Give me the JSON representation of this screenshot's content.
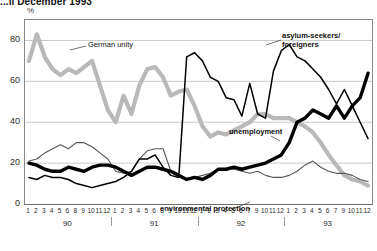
{
  "title": "...il December 1993",
  "axis": {
    "y_unit": "%",
    "y_ticks": [
      0,
      20,
      40,
      60,
      80
    ],
    "ylim": [
      0,
      90
    ],
    "year_labels": [
      "90",
      "91",
      "92",
      "93"
    ],
    "month_labels_90": [
      "1",
      "2",
      "3",
      "4",
      "5",
      "6",
      "8",
      "9",
      "10",
      "11",
      "12"
    ],
    "month_labels_91": [
      "1",
      "2",
      "3",
      "4",
      "5",
      "6",
      "8",
      "9",
      "10",
      "11",
      "12"
    ],
    "month_labels_92": [
      "1",
      "2",
      "3",
      "4",
      "5",
      "6",
      "7",
      "9",
      "10",
      "11",
      "12"
    ],
    "month_labels_93": [
      "1",
      "2",
      "3",
      "4",
      "5",
      "6",
      "7",
      "9",
      "10",
      "11",
      "12"
    ]
  },
  "series_labels": {
    "german_unity": "German unity",
    "asylum": "asylum-seekers/\nforeigners",
    "unemployment": "unemployment",
    "environment": "environmental protection"
  },
  "colors": {
    "german_unity": "#b9b9b9",
    "asylum": "#000000",
    "unemployment": "#000000",
    "environment": "#555555",
    "frame": "#8a8a8a",
    "grid": "#bdbdbd"
  },
  "chart_data": {
    "type": "line",
    "title": "...il December 1993",
    "xlabel": "",
    "ylabel": "%",
    "ylim": [
      0,
      90
    ],
    "grid": true,
    "legend": "inline-annotations",
    "x": [
      "90-1",
      "90-2",
      "90-3",
      "90-4",
      "90-5",
      "90-6",
      "90-8",
      "90-9",
      "90-10",
      "90-11",
      "90-12",
      "91-1",
      "91-2",
      "91-3",
      "91-4",
      "91-5",
      "91-6",
      "91-8",
      "91-9",
      "91-10",
      "91-11",
      "91-12",
      "92-1",
      "92-2",
      "92-3",
      "92-4",
      "92-5",
      "92-6",
      "92-7",
      "92-9",
      "92-10",
      "92-11",
      "92-12",
      "93-1",
      "93-2",
      "93-3",
      "93-4",
      "93-5",
      "93-6",
      "93-7",
      "93-9",
      "93-10",
      "93-11",
      "93-12"
    ],
    "series": [
      {
        "name": "German unity",
        "style": "thick-light-gray",
        "values": [
          70,
          83,
          72,
          66,
          63,
          66,
          64,
          67,
          70,
          58,
          46,
          40,
          53,
          44,
          58,
          66,
          67,
          62,
          53,
          55,
          56,
          48,
          38,
          33,
          35,
          34,
          36,
          38,
          40,
          44,
          44,
          42,
          42,
          42,
          40,
          38,
          35,
          30,
          24,
          19,
          14,
          12,
          11,
          9
        ]
      },
      {
        "name": "asylum-seekers/foreigners",
        "style": "thin-black",
        "values": [
          13,
          12,
          14,
          13,
          13,
          12,
          10,
          9,
          8,
          9,
          10,
          11,
          13,
          16,
          22,
          22,
          24,
          18,
          14,
          13,
          72,
          74,
          70,
          62,
          60,
          52,
          51,
          43,
          59,
          44,
          42,
          65,
          75,
          78,
          72,
          70,
          66,
          62,
          56,
          49,
          56,
          48,
          40,
          32
        ]
      },
      {
        "name": "unemployment",
        "style": "thick-black",
        "values": [
          20,
          19,
          17,
          16,
          16,
          18,
          17,
          16,
          18,
          19,
          19,
          18,
          16,
          14,
          16,
          18,
          18,
          17,
          16,
          14,
          12,
          13,
          12,
          14,
          17,
          17,
          18,
          17,
          18,
          19,
          20,
          22,
          24,
          30,
          40,
          42,
          46,
          44,
          42,
          48,
          42,
          48,
          52,
          64
        ]
      },
      {
        "name": "environmental protection",
        "style": "thin-dark-gray",
        "values": [
          21,
          22,
          25,
          27,
          29,
          27,
          30,
          30,
          28,
          25,
          22,
          16,
          15,
          16,
          22,
          26,
          27,
          27,
          16,
          14,
          12,
          13,
          14,
          15,
          17,
          17,
          17,
          16,
          15,
          16,
          14,
          13,
          13,
          14,
          16,
          19,
          21,
          18,
          16,
          15,
          15,
          14,
          12,
          11
        ]
      }
    ]
  }
}
